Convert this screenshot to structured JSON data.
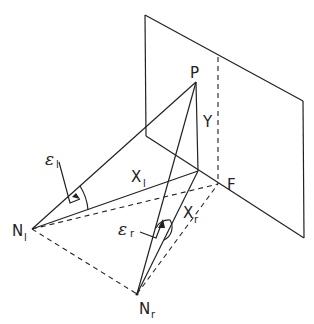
{
  "diagram": {
    "type": "stereo-geometry",
    "labels": {
      "point_p": "P",
      "point_f": "F",
      "height_y": "Y",
      "node_left": "N",
      "node_left_sub": "l",
      "node_right": "N",
      "node_right_sub": "r",
      "dist_left": "X",
      "dist_left_sub": "l",
      "dist_right": "X",
      "dist_right_sub": "r",
      "angle_left": "ε",
      "angle_left_sub": "l",
      "angle_right": "ε",
      "angle_right_sub": "r"
    },
    "points": {
      "P": [
        196,
        82
      ],
      "foot": [
        198,
        171
      ],
      "F": [
        218,
        184
      ],
      "N_l": [
        32,
        229
      ],
      "N_r": [
        137,
        294
      ]
    },
    "plane": {
      "corners": [
        [
          145,
          15
        ],
        [
          303,
          101
        ],
        [
          304,
          238
        ],
        [
          146,
          136
        ]
      ]
    }
  }
}
